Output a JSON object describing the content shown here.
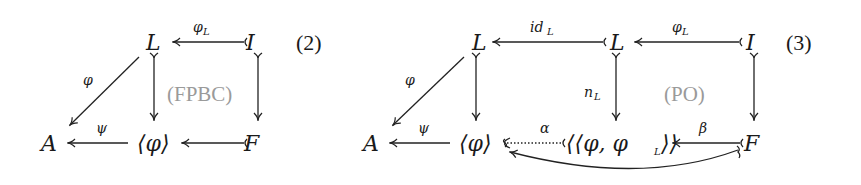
{
  "diagram2": {
    "equation_number": "(2)",
    "region_label": "(FPBC)",
    "nodes": {
      "L": "L",
      "I": "I",
      "A": "A",
      "phi_angle": "⟨φ⟩",
      "F": "F"
    },
    "arrows": [
      {
        "from": "I",
        "to": "L",
        "label": "φ",
        "label_sub": "L",
        "type": "mono"
      },
      {
        "from": "L",
        "to": "A",
        "label": "φ",
        "type": "plain"
      },
      {
        "from": "L",
        "to": "⟨φ⟩",
        "label": "",
        "type": "mono"
      },
      {
        "from": "I",
        "to": "F",
        "label": "",
        "type": "mono"
      },
      {
        "from": "⟨φ⟩",
        "to": "A",
        "label": "ψ",
        "type": "plain"
      },
      {
        "from": "F",
        "to": "⟨φ⟩",
        "label": "",
        "type": "mono"
      }
    ]
  },
  "diagram3": {
    "equation_number": "(3)",
    "region_label": "(PO)",
    "nodes": {
      "L1": "L",
      "L2": "L",
      "I": "I",
      "A": "A",
      "phi_angle": "⟨φ⟩",
      "pair": "⟨⟨φ, φ",
      "pair_sub": "L",
      "pair_close": "⟩⟩",
      "F": "F"
    },
    "arrows": [
      {
        "from": "L",
        "to": "L",
        "label": "id",
        "label_sub": "L",
        "type": "mono"
      },
      {
        "from": "I",
        "to": "L",
        "label": "φ",
        "label_sub": "L",
        "type": "mono"
      },
      {
        "from": "L",
        "to": "A",
        "label": "φ",
        "type": "plain"
      },
      {
        "from": "L",
        "to": "⟨φ⟩",
        "label": "",
        "type": "mono"
      },
      {
        "from": "L",
        "to": "⟨⟨φ,φL⟩⟩",
        "label": "n",
        "label_sub": "L",
        "type": "mono"
      },
      {
        "from": "I",
        "to": "F",
        "label": "",
        "type": "mono"
      },
      {
        "from": "⟨φ⟩",
        "to": "A",
        "label": "ψ",
        "type": "plain"
      },
      {
        "from": "⟨⟨φ,φL⟩⟩",
        "to": "⟨φ⟩",
        "label": "α",
        "type": "dotted-partial"
      },
      {
        "from": "F",
        "to": "⟨⟨φ,φL⟩⟩",
        "label": "β",
        "type": "mono"
      },
      {
        "from": "F",
        "to": "⟨φ⟩",
        "label": "",
        "type": "curved-partial"
      }
    ]
  }
}
